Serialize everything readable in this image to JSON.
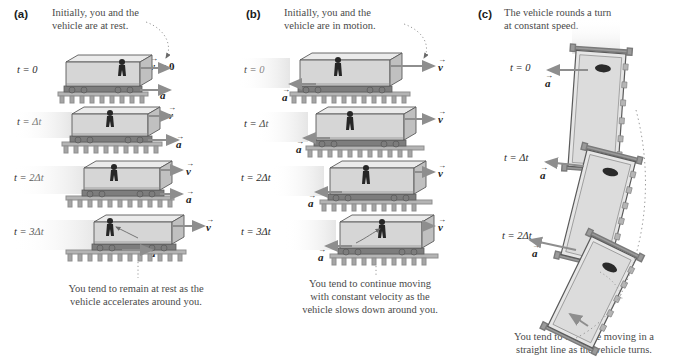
{
  "figure": {
    "type": "physics-diagram"
  },
  "panels": [
    {
      "id": "a",
      "label": "(a)",
      "head_caption_line1": "Initially, you and the",
      "head_caption_line2": "vehicle are at rest.",
      "bottom_caption_line1": "You tend to remain at rest as the",
      "bottom_caption_line2": "vehicle accelerates around you.",
      "frames": [
        {
          "time_label": "t = 0",
          "velocity_label": "v",
          "velocity_zero": true,
          "velocity_text": "= 0",
          "accel_label": "a",
          "v_len": 30,
          "a_len": 30
        },
        {
          "time_label": "t = Δt",
          "velocity_label": "v",
          "velocity_zero": false,
          "velocity_text": "",
          "accel_label": "a",
          "v_len": 24,
          "a_len": 30
        },
        {
          "time_label": "t = 2Δt",
          "velocity_label": "v",
          "velocity_zero": false,
          "velocity_text": "",
          "accel_label": "a",
          "v_len": 40,
          "a_len": 30
        },
        {
          "time_label": "t = 3Δt",
          "velocity_label": "v",
          "velocity_zero": false,
          "velocity_text": "",
          "accel_label": "a",
          "v_len": 58,
          "a_len": 30
        }
      ]
    },
    {
      "id": "b",
      "label": "(b)",
      "head_caption_line1": "Initially, you and the",
      "head_caption_line2": "vehicle are in motion.",
      "bottom_caption_line1": "You tend to continue moving",
      "bottom_caption_line2": "with constant velocity as the",
      "bottom_caption_line3": "vehicle slows down around you.",
      "frames": [
        {
          "time_label": "t = 0",
          "velocity_label": "v",
          "accel_label": "a",
          "v_len": 58,
          "a_len": 26
        },
        {
          "time_label": "t = Δt",
          "velocity_label": "v",
          "accel_label": "a",
          "v_len": 44,
          "a_len": 26
        },
        {
          "time_label": "t = 2Δt",
          "velocity_label": "v",
          "accel_label": "a",
          "v_len": 32,
          "a_len": 26
        },
        {
          "time_label": "t = 3Δt",
          "velocity_label": "v",
          "accel_label": "a",
          "v_len": 22,
          "a_len": 26
        }
      ]
    },
    {
      "id": "c",
      "label": "(c)",
      "head_caption_line1": "The vehicle rounds a turn",
      "head_caption_line2": "at constant speed.",
      "bottom_caption_line1": "You tend to continue moving in a",
      "bottom_caption_line2": "straight line as the vehicle turns.",
      "velocity_label": "v",
      "frames": [
        {
          "time_label": "t = 0",
          "accel_label": "a",
          "rotation": 4,
          "a_len": 42
        },
        {
          "time_label": "t = Δt",
          "accel_label": "a",
          "rotation": 14,
          "a_len": 40
        },
        {
          "time_label": "t = 2Δt",
          "accel_label": "a",
          "rotation": 26,
          "a_len": 46
        }
      ]
    }
  ],
  "symbols": {
    "velocity": "v",
    "acceleration": "a",
    "vector_accent": "→",
    "zero": "0"
  },
  "colors": {
    "body_fill": "#d9d9d9",
    "body_top": "#e8e8e8",
    "body_side": "#c2c2c2",
    "outline": "#4a4a4a",
    "arrow": "#8e8e8e",
    "person": "#2a2a2a",
    "track": "#9a9a9a",
    "text": "#4a4a4a",
    "motion_blur": "#ededed"
  }
}
